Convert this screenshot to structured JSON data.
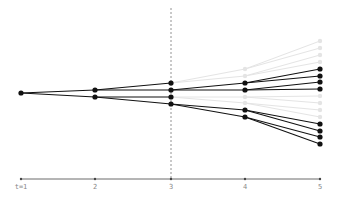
{
  "diagram": {
    "type": "branching-tree",
    "colors": {
      "active_edge": "#111111",
      "active_node": "#111111",
      "ghost_edge": "#e4e4e4",
      "ghost_node": "#e4e4e4",
      "axis": "#444444",
      "divider": "#777777",
      "label": "#888888"
    },
    "axis": {
      "y": 179,
      "ticks": [
        {
          "x": 21,
          "label": "t=1"
        },
        {
          "x": 95,
          "label": "2"
        },
        {
          "x": 171,
          "label": "3"
        },
        {
          "x": 245,
          "label": "4"
        },
        {
          "x": 320,
          "label": "5"
        }
      ]
    },
    "divider": {
      "x": 171,
      "y1": 8,
      "y2": 179
    },
    "nodes": [
      {
        "id": "r",
        "x": 21,
        "y": 93,
        "ghost": false
      },
      {
        "id": "a",
        "x": 95,
        "y": 90,
        "ghost": false
      },
      {
        "id": "b",
        "x": 95,
        "y": 97,
        "ghost": false
      },
      {
        "id": "a1",
        "x": 171,
        "y": 83,
        "ghost": false
      },
      {
        "id": "a2",
        "x": 171,
        "y": 90,
        "ghost": false
      },
      {
        "id": "b1",
        "x": 171,
        "y": 97,
        "ghost": false
      },
      {
        "id": "b2",
        "x": 171,
        "y": 104,
        "ghost": false
      },
      {
        "id": "a1x",
        "x": 245,
        "y": 69,
        "ghost": true
      },
      {
        "id": "a1y",
        "x": 245,
        "y": 76,
        "ghost": true
      },
      {
        "id": "a2x",
        "x": 245,
        "y": 83,
        "ghost": false
      },
      {
        "id": "a2y",
        "x": 245,
        "y": 90,
        "ghost": false
      },
      {
        "id": "b1x",
        "x": 245,
        "y": 97,
        "ghost": true
      },
      {
        "id": "b1y",
        "x": 245,
        "y": 103,
        "ghost": true
      },
      {
        "id": "b2x",
        "x": 245,
        "y": 110,
        "ghost": false
      },
      {
        "id": "b2y",
        "x": 245,
        "y": 117,
        "ghost": false
      },
      {
        "id": "g1",
        "x": 320,
        "y": 41,
        "ghost": true
      },
      {
        "id": "g2",
        "x": 320,
        "y": 48,
        "ghost": true
      },
      {
        "id": "g3",
        "x": 320,
        "y": 55,
        "ghost": true
      },
      {
        "id": "g4",
        "x": 320,
        "y": 62,
        "ghost": true
      },
      {
        "id": "d1",
        "x": 320,
        "y": 69,
        "ghost": false
      },
      {
        "id": "d2",
        "x": 320,
        "y": 76,
        "ghost": false
      },
      {
        "id": "d3",
        "x": 320,
        "y": 82,
        "ghost": false
      },
      {
        "id": "d4",
        "x": 320,
        "y": 89,
        "ghost": false
      },
      {
        "id": "g5",
        "x": 320,
        "y": 96,
        "ghost": true
      },
      {
        "id": "g6",
        "x": 320,
        "y": 103,
        "ghost": true
      },
      {
        "id": "g7",
        "x": 320,
        "y": 110,
        "ghost": true
      },
      {
        "id": "g8",
        "x": 320,
        "y": 117,
        "ghost": true
      },
      {
        "id": "d5",
        "x": 320,
        "y": 124,
        "ghost": false
      },
      {
        "id": "d6",
        "x": 320,
        "y": 131,
        "ghost": false
      },
      {
        "id": "d7",
        "x": 320,
        "y": 137,
        "ghost": false
      },
      {
        "id": "d8",
        "x": 320,
        "y": 144,
        "ghost": false
      }
    ],
    "edges": [
      [
        "r",
        "a"
      ],
      [
        "r",
        "b"
      ],
      [
        "a",
        "a1"
      ],
      [
        "a",
        "a2"
      ],
      [
        "b",
        "b1"
      ],
      [
        "b",
        "b2"
      ],
      [
        "a1",
        "a1x"
      ],
      [
        "a1",
        "a1y"
      ],
      [
        "a2",
        "a2x"
      ],
      [
        "a2",
        "a2y"
      ],
      [
        "b1",
        "b1x"
      ],
      [
        "b1",
        "b1y"
      ],
      [
        "b2",
        "b2x"
      ],
      [
        "b2",
        "b2y"
      ],
      [
        "a1x",
        "g1"
      ],
      [
        "a1x",
        "g2"
      ],
      [
        "a1y",
        "g3"
      ],
      [
        "a1y",
        "g4"
      ],
      [
        "a2x",
        "d1"
      ],
      [
        "a2x",
        "d2"
      ],
      [
        "a2y",
        "d3"
      ],
      [
        "a2y",
        "d4"
      ],
      [
        "b1x",
        "g5"
      ],
      [
        "b1x",
        "g6"
      ],
      [
        "b1y",
        "g7"
      ],
      [
        "b1y",
        "g8"
      ],
      [
        "b2x",
        "d5"
      ],
      [
        "b2x",
        "d6"
      ],
      [
        "b2y",
        "d7"
      ],
      [
        "b2y",
        "d8"
      ]
    ]
  }
}
